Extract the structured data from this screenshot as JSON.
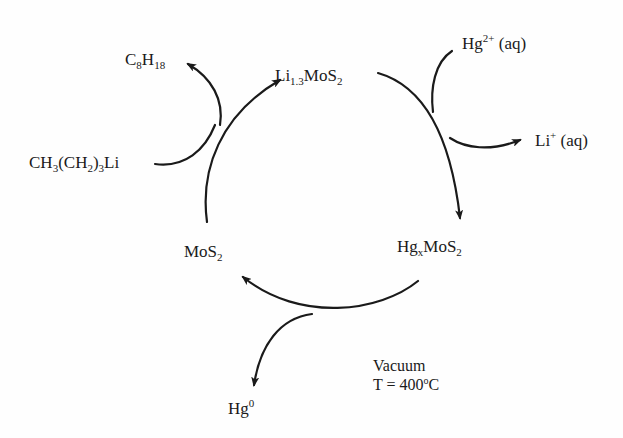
{
  "diagram": {
    "type": "reaction-cycle",
    "nodes": {
      "li_mos2": {
        "base": "Li",
        "sub": "1.3",
        "rest": "MoS",
        "sub2": "2"
      },
      "hg_mos2": {
        "base": "Hg",
        "sub": "x",
        "rest": "MoS",
        "sub2": "2"
      },
      "mos2": {
        "base": "MoS",
        "sub": "2"
      }
    },
    "reagents": {
      "butyllithium": {
        "p1": "CH",
        "s1": "3",
        "p2": "(CH",
        "s2": "2",
        "p3": ")",
        "s3": "3",
        "p4": "Li"
      },
      "octane": {
        "p1": "C",
        "s1": "8",
        "p2": "H",
        "s2": "18"
      },
      "hg_ion": {
        "base": "Hg",
        "sup": "2+",
        "state": " (aq)"
      },
      "li_ion": {
        "base": "Li",
        "sup": "+",
        "state": " (aq)"
      },
      "hg0": {
        "base": "Hg",
        "sup": "0"
      }
    },
    "conditions": {
      "line1": "Vacuum",
      "line2_prefix": "T = 400",
      "line2_sup": "o",
      "line2_suffix": "C"
    },
    "line_color": "#1a1a1a"
  }
}
